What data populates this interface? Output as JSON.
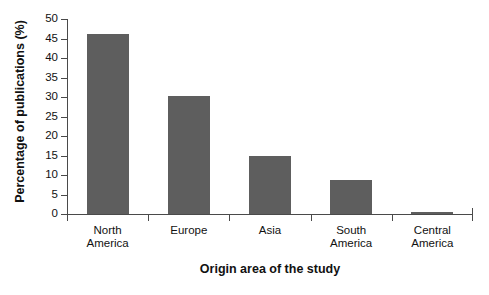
{
  "chart_data": {
    "type": "bar",
    "title": "",
    "xlabel": "Origin area of the study",
    "ylabel": "Percentage of publications (%)",
    "categories": [
      "North America",
      "Europe",
      "Asia",
      "South America",
      "Central America"
    ],
    "category_lines": [
      [
        "North",
        "America"
      ],
      [
        "Europe"
      ],
      [
        "Asia"
      ],
      [
        "South",
        "America"
      ],
      [
        "Central",
        "America"
      ]
    ],
    "values": [
      46.2,
      30.3,
      14.8,
      8.6,
      0.5
    ],
    "ylim": [
      0,
      50
    ],
    "yticks": [
      0,
      5,
      10,
      15,
      20,
      25,
      30,
      35,
      40,
      45,
      50
    ],
    "ytick_labels": [
      "0",
      "5",
      "10",
      "15",
      "20",
      "25",
      "30",
      "35",
      "40",
      "45",
      "50"
    ],
    "grid": false,
    "legend": null,
    "bar_color": "#5e5e5e",
    "axis_color": "#4a4a4a",
    "background": "#ffffff"
  }
}
